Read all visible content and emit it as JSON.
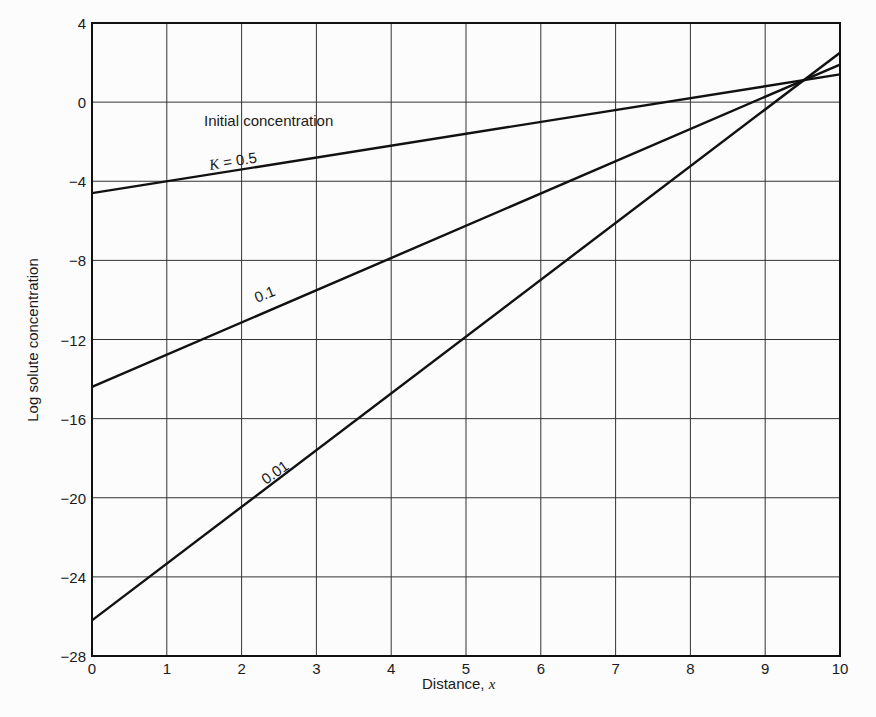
{
  "chart_data": {
    "type": "line",
    "title": "",
    "xlabel": "Distance, x",
    "ylabel": "Log solute concentration",
    "xlim": [
      0,
      10
    ],
    "ylim": [
      -28,
      4
    ],
    "grid": true,
    "xticks": [
      0,
      1,
      2,
      3,
      4,
      5,
      6,
      7,
      8,
      9,
      10
    ],
    "yticks": [
      4,
      0,
      -4,
      -8,
      -12,
      -16,
      -20,
      -24,
      -28
    ],
    "ytick_labels": [
      "4",
      "0",
      "−4",
      "−8",
      "−12",
      "−16",
      "−20",
      "−24",
      "−28"
    ],
    "series": [
      {
        "name": "K = 0.5",
        "x": [
          0,
          10
        ],
        "values": [
          -4.6,
          1.4
        ]
      },
      {
        "name": "0.1",
        "x": [
          0,
          10
        ],
        "values": [
          -14.4,
          1.9
        ]
      },
      {
        "name": "0.01",
        "x": [
          0,
          10
        ],
        "values": [
          -26.2,
          2.5
        ]
      }
    ],
    "annotations": [
      {
        "text": "Initial concentration",
        "x": 1.5,
        "y": -1.2
      },
      {
        "text": "K = 0.5",
        "x": 1.5,
        "y": -3.2
      },
      {
        "text": "0.1",
        "x": 2.3,
        "y": -10.6
      },
      {
        "text": "0.01",
        "x": 2.4,
        "y": -18.5
      }
    ]
  },
  "labels": {
    "xlabel_main": "Distance, ",
    "xlabel_var": "x",
    "ylabel": "Log solute concentration",
    "initial": "Initial concentration",
    "k_var": "K",
    "k_eq": " = 0.5",
    "k01": "0.1",
    "k001": "0.01"
  }
}
